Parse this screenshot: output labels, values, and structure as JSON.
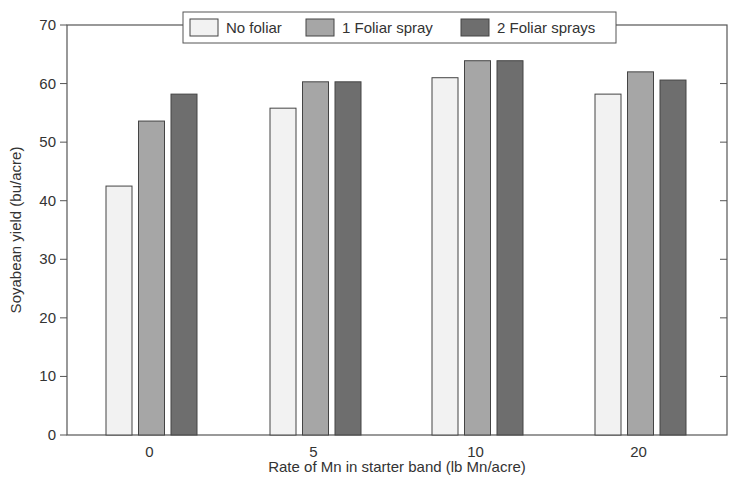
{
  "chart_data": {
    "type": "bar",
    "title": "",
    "xlabel": "Rate of Mn in starter band (lb Mn/acre)",
    "ylabel": "Soyabean yield (bu/acre)",
    "ylim": [
      0,
      70
    ],
    "yticks": [
      0,
      10,
      20,
      30,
      40,
      50,
      60,
      70
    ],
    "grid": false,
    "legend_position": "top-center",
    "categories": [
      "0",
      "5",
      "10",
      "20"
    ],
    "series": [
      {
        "name": "No foliar",
        "color": "#f2f2f2",
        "values": [
          42.5,
          55.8,
          61.0,
          58.2
        ]
      },
      {
        "name": "1 Foliar spray",
        "color": "#a6a6a6",
        "values": [
          53.6,
          60.3,
          63.9,
          62.0
        ]
      },
      {
        "name": "2 Foliar sprays",
        "color": "#6e6e6e",
        "values": [
          58.2,
          60.3,
          63.9,
          60.6
        ]
      }
    ]
  },
  "legend": {
    "items": [
      {
        "label": "No foliar",
        "color": "#f2f2f2"
      },
      {
        "label": "1 Foliar spray",
        "color": "#a6a6a6"
      },
      {
        "label": "2 Foliar sprays",
        "color": "#6e6e6e"
      }
    ]
  },
  "axes": {
    "x_title": "Rate of Mn in starter band (lb Mn/acre)",
    "y_title": "Soyabean yield (bu/acre)",
    "y_tick_labels": [
      "0",
      "10",
      "20",
      "30",
      "40",
      "50",
      "60",
      "70"
    ],
    "x_tick_labels": [
      "0",
      "5",
      "10",
      "20"
    ]
  }
}
